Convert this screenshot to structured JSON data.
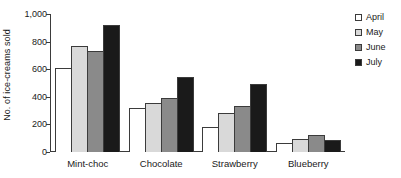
{
  "chart_data": {
    "type": "bar",
    "title": "",
    "xlabel": "",
    "ylabel": "No. of ice-creams sold",
    "categories": [
      "Mint-choc",
      "Chocolate",
      "Strawberry",
      "Blueberry"
    ],
    "series": [
      {
        "name": "April",
        "color": "#ffffff",
        "values": [
          610,
          320,
          180,
          65
        ]
      },
      {
        "name": "May",
        "color": "#d9d9d9",
        "values": [
          770,
          355,
          285,
          95
        ]
      },
      {
        "name": "June",
        "color": "#8a8a8a",
        "values": [
          735,
          395,
          335,
          120
        ]
      },
      {
        "name": "July",
        "color": "#1a1a1a",
        "values": [
          920,
          540,
          490,
          90
        ]
      }
    ],
    "ylim": [
      0,
      1000
    ],
    "yticks": [
      0,
      200,
      400,
      600,
      800,
      1000
    ],
    "ytick_labels": [
      "0",
      "200",
      "400",
      "600",
      "800",
      "1,000"
    ],
    "grid": false,
    "legend_position": "top-right",
    "axis_color": "#3b3b3b",
    "bar_outline_color": "#3b3b3b"
  }
}
